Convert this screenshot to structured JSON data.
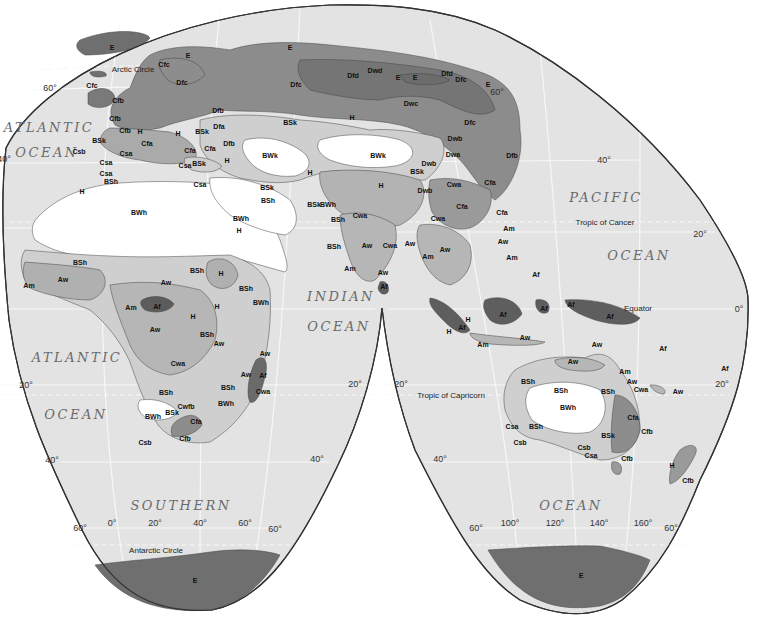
{
  "map": {
    "title": "World Climate Regions (Köppen) — Interrupted Projection, Eastern Hemisphere",
    "colors": {
      "ocean": "#e3e3e3",
      "background": "#ffffff",
      "graticule": "#f6f6f6",
      "E": "#6f6f6f",
      "D_dark": "#858585",
      "D": "#9a9a9a",
      "C": "#a9a9a9",
      "A_f": "#5c5c5c",
      "A_w": "#b6b6b6",
      "B_steppe": "#cdcdcd",
      "B_desert": "#ffffff",
      "H": "#b0b0b0",
      "outline": "#333333"
    },
    "oceans": [
      {
        "id": "atlantic-n-1",
        "text": "ATLANTIC",
        "x": 49,
        "y": 127
      },
      {
        "id": "atlantic-n-2",
        "text": "OCEAN",
        "x": 47,
        "y": 152
      },
      {
        "id": "pacific-1",
        "text": "PACIFIC",
        "x": 606,
        "y": 197
      },
      {
        "id": "pacific-2",
        "text": "OCEAN",
        "x": 639,
        "y": 255
      },
      {
        "id": "indian-1",
        "text": "INDIAN",
        "x": 341,
        "y": 296
      },
      {
        "id": "indian-2",
        "text": "OCEAN",
        "x": 339,
        "y": 326
      },
      {
        "id": "atlantic-s-1",
        "text": "ATLANTIC",
        "x": 77,
        "y": 357
      },
      {
        "id": "atlantic-s-2",
        "text": "OCEAN",
        "x": 76,
        "y": 414
      },
      {
        "id": "southern-1",
        "text": "SOUTHERN",
        "x": 181,
        "y": 505
      },
      {
        "id": "southern-2",
        "text": "OCEAN",
        "x": 571,
        "y": 505
      }
    ],
    "lines": [
      {
        "id": "arctic-circle",
        "text": "Arctic Circle",
        "x": 133,
        "y": 69
      },
      {
        "id": "tropic-cancer",
        "text": "Tropic of Cancer",
        "x": 605,
        "y": 222
      },
      {
        "id": "equator",
        "text": "Equator",
        "x": 638,
        "y": 308
      },
      {
        "id": "tropic-capricorn",
        "text": "Tropic of Capricorn",
        "x": 451,
        "y": 395
      },
      {
        "id": "antarctic-circle",
        "text": "Antarctic Circle",
        "x": 156,
        "y": 550
      }
    ],
    "degrees": [
      {
        "text": "60°",
        "x": 50,
        "y": 88
      },
      {
        "text": "40°",
        "x": 4,
        "y": 159
      },
      {
        "text": "60°",
        "x": 497,
        "y": 92
      },
      {
        "text": "40°",
        "x": 604,
        "y": 160
      },
      {
        "text": "20°",
        "x": 700,
        "y": 234
      },
      {
        "text": "0°",
        "x": 739,
        "y": 309
      },
      {
        "text": "20°",
        "x": 26,
        "y": 385
      },
      {
        "text": "20°",
        "x": 355,
        "y": 384
      },
      {
        "text": "20°",
        "x": 401,
        "y": 384
      },
      {
        "text": "20°",
        "x": 722,
        "y": 384
      },
      {
        "text": "40°",
        "x": 52,
        "y": 460
      },
      {
        "text": "40°",
        "x": 317,
        "y": 459
      },
      {
        "text": "40°",
        "x": 440,
        "y": 459
      },
      {
        "text": "60°",
        "x": 80,
        "y": 528
      },
      {
        "text": "0°",
        "x": 112,
        "y": 523
      },
      {
        "text": "20°",
        "x": 155,
        "y": 523
      },
      {
        "text": "40°",
        "x": 200,
        "y": 523
      },
      {
        "text": "60°",
        "x": 245,
        "y": 523
      },
      {
        "text": "60°",
        "x": 275,
        "y": 529
      },
      {
        "text": "60°",
        "x": 476,
        "y": 528
      },
      {
        "text": "100°",
        "x": 510,
        "y": 523
      },
      {
        "text": "120°",
        "x": 555,
        "y": 523
      },
      {
        "text": "140°",
        "x": 599,
        "y": 523
      },
      {
        "text": "160°",
        "x": 643,
        "y": 523
      },
      {
        "text": "60°",
        "x": 671,
        "y": 528
      }
    ],
    "climate_labels": [
      {
        "t": "E",
        "x": 112,
        "y": 47
      },
      {
        "t": "E",
        "x": 188,
        "y": 55
      },
      {
        "t": "Cfc",
        "x": 164,
        "y": 64
      },
      {
        "t": "Cfc",
        "x": 92,
        "y": 85
      },
      {
        "t": "Cfb",
        "x": 118,
        "y": 100
      },
      {
        "t": "Dfc",
        "x": 182,
        "y": 82
      },
      {
        "t": "Cfb",
        "x": 115,
        "y": 118
      },
      {
        "t": "Dfb",
        "x": 218,
        "y": 110
      },
      {
        "t": "Cfb",
        "x": 125,
        "y": 130
      },
      {
        "t": "H",
        "x": 140,
        "y": 131
      },
      {
        "t": "H",
        "x": 178,
        "y": 133
      },
      {
        "t": "BSk",
        "x": 202,
        "y": 131
      },
      {
        "t": "Dfa",
        "x": 219,
        "y": 126
      },
      {
        "t": "Dfb",
        "x": 229,
        "y": 143
      },
      {
        "t": "BSk",
        "x": 99,
        "y": 140
      },
      {
        "t": "Csb",
        "x": 79,
        "y": 151
      },
      {
        "t": "Csa",
        "x": 126,
        "y": 153
      },
      {
        "t": "Cfa",
        "x": 147,
        "y": 143
      },
      {
        "t": "Cfa",
        "x": 190,
        "y": 150
      },
      {
        "t": "Cfa",
        "x": 210,
        "y": 148
      },
      {
        "t": "BSk",
        "x": 199,
        "y": 163
      },
      {
        "t": "Csa",
        "x": 185,
        "y": 165
      },
      {
        "t": "H",
        "x": 227,
        "y": 160
      },
      {
        "t": "Csa",
        "x": 106,
        "y": 162
      },
      {
        "t": "Csa",
        "x": 106,
        "y": 173
      },
      {
        "t": "BSh",
        "x": 111,
        "y": 181
      },
      {
        "t": "H",
        "x": 82,
        "y": 191
      },
      {
        "t": "Csa",
        "x": 200,
        "y": 184
      },
      {
        "t": "E",
        "x": 290,
        "y": 47
      },
      {
        "t": "Dfc",
        "x": 296,
        "y": 84
      },
      {
        "t": "Dfd",
        "x": 353,
        "y": 75
      },
      {
        "t": "Dwd",
        "x": 375,
        "y": 70
      },
      {
        "t": "E",
        "x": 398,
        "y": 77
      },
      {
        "t": "E",
        "x": 415,
        "y": 77
      },
      {
        "t": "Dfd",
        "x": 447,
        "y": 73
      },
      {
        "t": "Dfc",
        "x": 461,
        "y": 79
      },
      {
        "t": "E",
        "x": 488,
        "y": 84
      },
      {
        "t": "Dwc",
        "x": 411,
        "y": 103
      },
      {
        "t": "BSk",
        "x": 290,
        "y": 122
      },
      {
        "t": "H",
        "x": 352,
        "y": 117
      },
      {
        "t": "Dfc",
        "x": 470,
        "y": 122
      },
      {
        "t": "Dwb",
        "x": 455,
        "y": 138
      },
      {
        "t": "Dwa",
        "x": 453,
        "y": 154
      },
      {
        "t": "Dfb",
        "x": 512,
        "y": 155
      },
      {
        "t": "BWk",
        "x": 270,
        "y": 155
      },
      {
        "t": "BWk",
        "x": 378,
        "y": 155
      },
      {
        "t": "Dwb",
        "x": 429,
        "y": 163
      },
      {
        "t": "BSk",
        "x": 417,
        "y": 171
      },
      {
        "t": "Cfa",
        "x": 490,
        "y": 182
      },
      {
        "t": "H",
        "x": 310,
        "y": 172
      },
      {
        "t": "H",
        "x": 381,
        "y": 185
      },
      {
        "t": "Dwb",
        "x": 425,
        "y": 190
      },
      {
        "t": "Cwa",
        "x": 454,
        "y": 184
      },
      {
        "t": "Cfa",
        "x": 462,
        "y": 206
      },
      {
        "t": "BSk",
        "x": 267,
        "y": 187
      },
      {
        "t": "BSh",
        "x": 268,
        "y": 200
      },
      {
        "t": "BSk",
        "x": 314,
        "y": 204
      },
      {
        "t": "BWh",
        "x": 328,
        "y": 204
      },
      {
        "t": "BSh",
        "x": 338,
        "y": 219
      },
      {
        "t": "Cwa",
        "x": 360,
        "y": 215
      },
      {
        "t": "Cfa",
        "x": 502,
        "y": 212
      },
      {
        "t": "Cwa",
        "x": 438,
        "y": 218
      },
      {
        "t": "Am",
        "x": 509,
        "y": 228
      },
      {
        "t": "Aw",
        "x": 503,
        "y": 241
      },
      {
        "t": "Am",
        "x": 512,
        "y": 257
      },
      {
        "t": "BWh",
        "x": 139,
        "y": 212
      },
      {
        "t": "BWh",
        "x": 241,
        "y": 218
      },
      {
        "t": "H",
        "x": 239,
        "y": 230
      },
      {
        "t": "BSh",
        "x": 334,
        "y": 246
      },
      {
        "t": "Aw",
        "x": 367,
        "y": 245
      },
      {
        "t": "Cwa",
        "x": 390,
        "y": 245
      },
      {
        "t": "Aw",
        "x": 410,
        "y": 243
      },
      {
        "t": "Am",
        "x": 428,
        "y": 256
      },
      {
        "t": "Aw",
        "x": 445,
        "y": 249
      },
      {
        "t": "Am",
        "x": 350,
        "y": 268
      },
      {
        "t": "Aw",
        "x": 383,
        "y": 272
      },
      {
        "t": "Af",
        "x": 384,
        "y": 286
      },
      {
        "t": "Af",
        "x": 536,
        "y": 274
      },
      {
        "t": "BSh",
        "x": 80,
        "y": 262
      },
      {
        "t": "Am",
        "x": 29,
        "y": 285
      },
      {
        "t": "Aw",
        "x": 63,
        "y": 279
      },
      {
        "t": "BSh",
        "x": 197,
        "y": 270
      },
      {
        "t": "Aw",
        "x": 166,
        "y": 282
      },
      {
        "t": "H",
        "x": 221,
        "y": 273
      },
      {
        "t": "BSh",
        "x": 246,
        "y": 288
      },
      {
        "t": "BWh",
        "x": 261,
        "y": 302
      },
      {
        "t": "Am",
        "x": 131,
        "y": 307
      },
      {
        "t": "Af",
        "x": 157,
        "y": 306
      },
      {
        "t": "H",
        "x": 217,
        "y": 306
      },
      {
        "t": "H",
        "x": 193,
        "y": 316
      },
      {
        "t": "Aw",
        "x": 155,
        "y": 329
      },
      {
        "t": "BSh",
        "x": 207,
        "y": 334
      },
      {
        "t": "Aw",
        "x": 219,
        "y": 343
      },
      {
        "t": "Cwa",
        "x": 178,
        "y": 363
      },
      {
        "t": "Aw",
        "x": 265,
        "y": 353
      },
      {
        "t": "Aw",
        "x": 246,
        "y": 374
      },
      {
        "t": "Af",
        "x": 263,
        "y": 375
      },
      {
        "t": "BSh",
        "x": 228,
        "y": 387
      },
      {
        "t": "Cwa",
        "x": 263,
        "y": 391
      },
      {
        "t": "BSh",
        "x": 166,
        "y": 392
      },
      {
        "t": "BWh",
        "x": 226,
        "y": 403
      },
      {
        "t": "Cwfb",
        "x": 186,
        "y": 406
      },
      {
        "t": "BSk",
        "x": 172,
        "y": 412
      },
      {
        "t": "BWh",
        "x": 153,
        "y": 416
      },
      {
        "t": "Cfa",
        "x": 196,
        "y": 421
      },
      {
        "t": "Csb",
        "x": 145,
        "y": 442
      },
      {
        "t": "Cfb",
        "x": 185,
        "y": 438
      },
      {
        "t": "H",
        "x": 468,
        "y": 319
      },
      {
        "t": "Af",
        "x": 462,
        "y": 327
      },
      {
        "t": "H",
        "x": 449,
        "y": 331
      },
      {
        "t": "Af",
        "x": 503,
        "y": 314
      },
      {
        "t": "Af",
        "x": 544,
        "y": 308
      },
      {
        "t": "Af",
        "x": 571,
        "y": 304
      },
      {
        "t": "Af",
        "x": 610,
        "y": 316
      },
      {
        "t": "Am",
        "x": 483,
        "y": 344
      },
      {
        "t": "Aw",
        "x": 525,
        "y": 337
      },
      {
        "t": "Aw",
        "x": 597,
        "y": 344
      },
      {
        "t": "Af",
        "x": 663,
        "y": 348
      },
      {
        "t": "Aw",
        "x": 573,
        "y": 361
      },
      {
        "t": "Am",
        "x": 625,
        "y": 371
      },
      {
        "t": "Aw",
        "x": 632,
        "y": 381
      },
      {
        "t": "Cwa",
        "x": 641,
        "y": 389
      },
      {
        "t": "BSh",
        "x": 528,
        "y": 381
      },
      {
        "t": "BSh",
        "x": 561,
        "y": 390
      },
      {
        "t": "BSh",
        "x": 608,
        "y": 391
      },
      {
        "t": "BWh",
        "x": 568,
        "y": 407
      },
      {
        "t": "Cfa",
        "x": 633,
        "y": 417
      },
      {
        "t": "Cfb",
        "x": 647,
        "y": 431
      },
      {
        "t": "Csa",
        "x": 512,
        "y": 426
      },
      {
        "t": "BSh",
        "x": 536,
        "y": 426
      },
      {
        "t": "BSk",
        "x": 608,
        "y": 435
      },
      {
        "t": "Csb",
        "x": 520,
        "y": 442
      },
      {
        "t": "Csb",
        "x": 584,
        "y": 447
      },
      {
        "t": "Csa",
        "x": 591,
        "y": 455
      },
      {
        "t": "Cfb",
        "x": 627,
        "y": 458
      },
      {
        "t": "Af",
        "x": 725,
        "y": 368
      },
      {
        "t": "Aw",
        "x": 678,
        "y": 391
      },
      {
        "t": "H",
        "x": 672,
        "y": 465
      },
      {
        "t": "Cfb",
        "x": 688,
        "y": 480
      },
      {
        "t": "E",
        "x": 195,
        "y": 580
      },
      {
        "t": "E",
        "x": 581,
        "y": 575
      }
    ]
  }
}
